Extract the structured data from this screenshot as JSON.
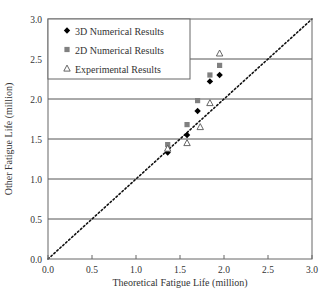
{
  "chart_data": {
    "type": "scatter",
    "title": "",
    "xlabel": "Theoretical Fatigue Life (million)",
    "ylabel": "Other Fatigue Life (million)",
    "xlim": [
      0.0,
      3.0
    ],
    "ylim": [
      0.0,
      3.0
    ],
    "x_ticks": [
      "0.0",
      "0.5",
      "1.0",
      "1.5",
      "2.0",
      "2.5",
      "3.0"
    ],
    "y_ticks": [
      "0.0",
      "0.5",
      "1.0",
      "1.5",
      "2.0",
      "2.5",
      "3.0"
    ],
    "grid": {
      "horizontal": true,
      "vertical": false
    },
    "legend_position": "upper-left",
    "reference_line": {
      "type": "dotted",
      "label": "y = x",
      "from": [
        0,
        0
      ],
      "to": [
        3,
        3
      ]
    },
    "series": [
      {
        "name": "3D Numerical Results",
        "marker": "diamond",
        "color": "#000000",
        "x": [
          1.36,
          1.58,
          1.7,
          1.84,
          1.95
        ],
        "y": [
          1.33,
          1.55,
          1.85,
          2.22,
          2.3
        ]
      },
      {
        "name": "2D Numerical Results",
        "marker": "square",
        "color": "#808080",
        "x": [
          1.36,
          1.58,
          1.7,
          1.84,
          1.95
        ],
        "y": [
          1.43,
          1.68,
          1.98,
          2.3,
          2.42
        ]
      },
      {
        "name": "Experimental Results",
        "marker": "triangle-open",
        "color": "#555555",
        "x": [
          1.36,
          1.58,
          1.73,
          1.84,
          1.95
        ],
        "y": [
          1.38,
          1.45,
          1.65,
          1.95,
          2.57
        ]
      }
    ]
  },
  "legend": {
    "items": [
      {
        "label": "3D Numerical Results",
        "marker": "diamond"
      },
      {
        "label": "2D Numerical Results",
        "marker": "square"
      },
      {
        "label": "Experimental Results",
        "marker": "triangle-open"
      }
    ]
  },
  "colors": {
    "axis": "#666666",
    "grid": "#555555",
    "diamond": "#000000",
    "square": "#808080",
    "triangle": "#555555",
    "text": "#333333"
  }
}
